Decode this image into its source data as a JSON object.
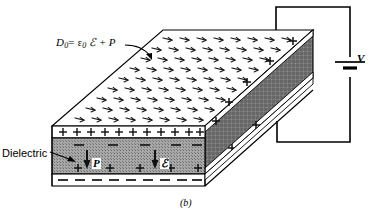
{
  "figure": {
    "caption": "(b)",
    "type": "physics-diagram"
  },
  "labels": {
    "formula": {
      "lhs": "D",
      "lhs_sub": "0",
      "equals": "=",
      "eps": "ε",
      "eps_sub": "0",
      "script_e": "ℰ",
      "plus": "+",
      "polarization": "P",
      "full_text": "D0 = ε0 ℰ + P"
    },
    "dielectric": "Dielectric",
    "voltage": "V",
    "polarization_vector": "P",
    "field_vector": "ℰ"
  },
  "charges": {
    "top_plate_sign": "+",
    "top_plate_count": 11,
    "bound_top_sign": "–",
    "bound_top_count": 5,
    "bound_bottom_sign": "+",
    "bound_bottom_count": 5,
    "bottom_plate_sign": "–",
    "bottom_plate_count": 9,
    "right_face_upper_sign": "+",
    "right_face_lower_sign": "+"
  },
  "circuit": {
    "source_type": "battery",
    "source_label": "V",
    "wire_color": "#000000"
  },
  "colors": {
    "line": "#000000",
    "dielectric_fill": "#9a9a9a",
    "side_face_fill": "#6f6f6f",
    "top_face_fill": "#ffffff",
    "plate_fill": "#ffffff",
    "background": "#ffffff"
  },
  "field_pattern": {
    "glyph": "arrow-dart",
    "description": "array of small arrow glyphs on top face representing D field",
    "rows": 9,
    "per_row_max": 10
  }
}
